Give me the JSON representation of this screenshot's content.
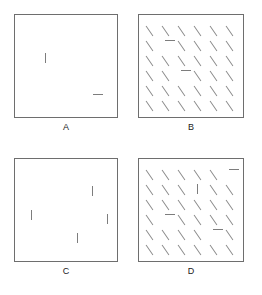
{
  "figure": {
    "title": "",
    "background_color": "#ffffff",
    "stroke_color": "#7d7d7d",
    "box_border_color": "#6e6e6e",
    "label_color": "#1a1a1a"
  },
  "panels": [
    {
      "id": "a",
      "label": "A",
      "type": "sparse",
      "items": [
        {
          "orientation": "vertical",
          "x": 30,
          "y": 38
        },
        {
          "orientation": "horizontal",
          "x": 78,
          "y": 79
        }
      ]
    },
    {
      "id": "b",
      "label": "B",
      "type": "grid",
      "rows": 6,
      "cols": 6,
      "default_orientation": "diagonal",
      "odd_items": [
        {
          "row": 2,
          "col": 2,
          "orientation": "horizontal"
        },
        {
          "row": 4,
          "col": 3,
          "orientation": "horizontal"
        }
      ]
    },
    {
      "id": "c",
      "label": "C",
      "type": "sparse",
      "items": [
        {
          "orientation": "vertical",
          "x": 16,
          "y": 51
        },
        {
          "orientation": "vertical",
          "x": 77,
          "y": 27
        },
        {
          "orientation": "vertical",
          "x": 62,
          "y": 74
        },
        {
          "orientation": "vertical",
          "x": 92,
          "y": 55
        }
      ]
    },
    {
      "id": "d",
      "label": "D",
      "type": "grid",
      "rows": 6,
      "cols": 6,
      "default_orientation": "diagonal",
      "odd_items": [
        {
          "row": 1,
          "col": 6,
          "orientation": "horizontal"
        },
        {
          "row": 2,
          "col": 4,
          "orientation": "vertical"
        },
        {
          "row": 4,
          "col": 2,
          "orientation": "horizontal"
        },
        {
          "row": 5,
          "col": 5,
          "orientation": "horizontal"
        }
      ]
    }
  ],
  "grid_geometry": {
    "origin_x": 10,
    "origin_y": 10,
    "step_x": 16,
    "step_y": 15,
    "segment_length": 10
  }
}
